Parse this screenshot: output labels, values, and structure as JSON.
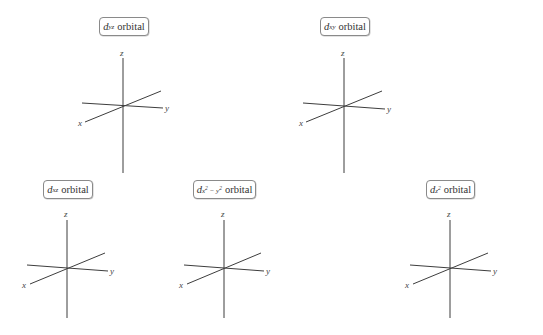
{
  "orbitals": [
    {
      "id": "dyz",
      "label": {
        "symbol": "d",
        "subscript": "yz",
        "superscripts": [],
        "word": "orbital",
        "text": "d_yz orbital"
      },
      "box": {
        "x": 99,
        "y": 17,
        "w": 50
      },
      "origin": {
        "x": 123,
        "y": 106
      },
      "axis_labels": {
        "x": "x",
        "y": "y",
        "z": "z"
      }
    },
    {
      "id": "dxy",
      "label": {
        "symbol": "d",
        "subscript": "xy",
        "superscripts": [],
        "word": "orbital",
        "text": "d_xy orbital"
      },
      "box": {
        "x": 320,
        "y": 17,
        "w": 50
      },
      "origin": {
        "x": 344,
        "y": 106
      },
      "axis_labels": {
        "x": "x",
        "y": "y",
        "z": "z"
      }
    },
    {
      "id": "dxz",
      "label": {
        "symbol": "d",
        "subscript": "xz",
        "superscripts": [],
        "word": "orbital",
        "text": "d_xz orbital"
      },
      "box": {
        "x": 43,
        "y": 180,
        "w": 50
      },
      "origin": {
        "x": 67,
        "y": 268
      },
      "axis_labels": {
        "x": "x",
        "y": "y",
        "z": "z"
      }
    },
    {
      "id": "dx2-y2",
      "label": {
        "symbol": "d",
        "subscript": "x2 − y2",
        "superscripts": [
          "2",
          "2"
        ],
        "word": "orbital",
        "text": "d_x²−y² orbital"
      },
      "box": {
        "x": 193,
        "y": 180,
        "w": 63
      },
      "origin": {
        "x": 224,
        "y": 268
      },
      "axis_labels": {
        "x": "x",
        "y": "y",
        "z": "z"
      }
    },
    {
      "id": "dz2",
      "label": {
        "symbol": "d",
        "subscript": "z2",
        "superscripts": [
          "2"
        ],
        "word": "orbital",
        "text": "d_z² orbital"
      },
      "box": {
        "x": 426,
        "y": 180,
        "w": 49
      },
      "origin": {
        "x": 450,
        "y": 268
      },
      "axis_labels": {
        "x": "x",
        "y": "y",
        "z": "z"
      }
    }
  ],
  "labels": {
    "dyz": {
      "d": "d",
      "sub": "yz",
      "word": "orbital"
    },
    "dxy": {
      "d": "d",
      "sub": "xy",
      "word": "orbital"
    },
    "dxz": {
      "d": "d",
      "sub": "xz",
      "word": "orbital"
    },
    "dx2y2": {
      "d": "d",
      "sub_a": "x",
      "sup_a": "2",
      "minus": " − ",
      "sub_b": "y",
      "sup_b": "2",
      "word": "orbital"
    },
    "dz2": {
      "d": "d",
      "sub": "z",
      "sup": "2",
      "word": "orbital"
    }
  },
  "axis_letters": {
    "x": "x",
    "y": "y",
    "z": "z"
  },
  "colors": {
    "line": "#3d3d3d",
    "box_border": "#8a8a8a",
    "background": "#ffffff"
  }
}
